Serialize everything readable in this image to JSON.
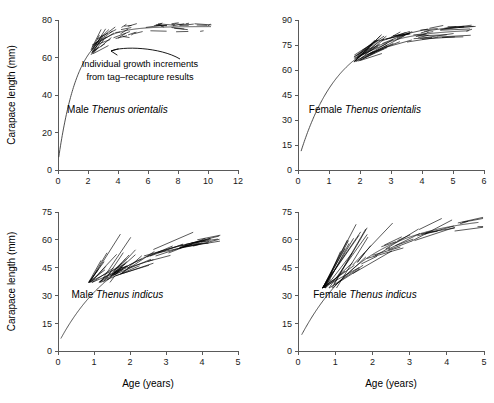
{
  "figure": {
    "name": "lobster-growth-curves",
    "shared_ylabel": "Carapace length (mm)",
    "shared_xlabel": "Age (years)",
    "annotation_line1": "Individual growth increments",
    "annotation_line2": "from tag–recapture results",
    "curve_color": "#3a3a3a",
    "increment_color": "#000000",
    "axis_color": "#5a5a5a",
    "background": "#ffffff"
  },
  "chart_data": [
    {
      "type": "line",
      "panel": "top-left",
      "title": "Male Thenus orientalis",
      "label_plain": "Male ",
      "label_italic": "Thenus orientalis",
      "xlabel": "",
      "ylabel": "Carapace length (mm)",
      "xlim": [
        0,
        12
      ],
      "ylim": [
        0,
        80
      ],
      "xticks": [
        0,
        2,
        4,
        6,
        8,
        10,
        12
      ],
      "yticks": [
        0,
        20,
        40,
        60,
        80
      ],
      "grid": false,
      "legend": "none",
      "annotation": "Individual growth increments from tag–recapture results",
      "growth_model": "von Bertalanffy",
      "Linf": 76.5,
      "K": 0.78,
      "t0": -0.07,
      "curve_x_range": [
        0.05,
        10.2
      ],
      "series": [
        {
          "name": "von Bertalanffy fitted curve",
          "x": [
            0.05,
            0.3,
            0.6,
            1.0,
            1.4,
            1.8,
            2.2,
            2.6,
            3.0,
            3.5,
            4.0,
            4.5,
            5.0,
            6.0,
            7.0,
            8.0,
            9.0,
            10.2
          ],
          "y": [
            4.6,
            20.2,
            33.0,
            45.5,
            54.5,
            61.0,
            65.7,
            69.1,
            71.6,
            73.6,
            74.9,
            75.7,
            76.0,
            76.3,
            76.4,
            76.5,
            76.5,
            76.5
          ]
        }
      ],
      "increments": {
        "count": 58,
        "description": "short line segments joining tag and recapture carapace lengths",
        "x_range": [
          2.2,
          10.0
        ],
        "y_range": [
          58,
          78
        ]
      }
    },
    {
      "type": "line",
      "panel": "top-right",
      "title": "Female Thenus orientalis",
      "label_plain": "Female ",
      "label_italic": "Thenus orientalis",
      "xlabel": "",
      "ylabel": "",
      "xlim": [
        0,
        6
      ],
      "ylim": [
        0,
        90
      ],
      "xticks": [
        0,
        1,
        2,
        3,
        4,
        5,
        6
      ],
      "yticks": [
        0,
        15,
        30,
        45,
        60,
        75,
        90
      ],
      "grid": false,
      "legend": "none",
      "growth_model": "von Bertalanffy",
      "Linf": 84.5,
      "K": 0.8,
      "t0": -0.08,
      "curve_x_range": [
        0.1,
        5.5
      ],
      "series": [
        {
          "name": "von Bertalanffy fitted curve",
          "x": [
            0.1,
            0.3,
            0.6,
            0.9,
            1.2,
            1.5,
            1.8,
            2.1,
            2.5,
            3.0,
            3.5,
            4.0,
            4.5,
            5.0,
            5.5
          ],
          "y": [
            5.5,
            18.5,
            31.5,
            42.0,
            50.8,
            58.0,
            64.0,
            68.8,
            73.8,
            78.2,
            81.0,
            82.7,
            83.6,
            84.1,
            84.4
          ]
        }
      ],
      "increments": {
        "count": 62,
        "description": "short line segments joining tag and recapture carapace lengths",
        "x_range": [
          1.8,
          5.5
        ],
        "y_range": [
          65,
          88
        ]
      }
    },
    {
      "type": "line",
      "panel": "bottom-left",
      "title": "Male Thenus indicus",
      "label_plain": "Male ",
      "label_italic": "Thenus indicus",
      "xlabel": "Age (years)",
      "ylabel": "Carapace length (mm)",
      "xlim": [
        0,
        5
      ],
      "ylim": [
        0,
        75
      ],
      "xticks": [
        0,
        1,
        2,
        3,
        4,
        5
      ],
      "yticks": [
        0,
        15,
        30,
        45,
        60,
        75
      ],
      "grid": false,
      "legend": "none",
      "growth_model": "von Bertalanffy",
      "Linf": 64.0,
      "K": 0.62,
      "t0": -0.1,
      "curve_x_range": [
        0.08,
        4.1
      ],
      "series": [
        {
          "name": "von Bertalanffy fitted curve",
          "x": [
            0.08,
            0.3,
            0.6,
            0.9,
            1.2,
            1.5,
            1.8,
            2.1,
            2.5,
            3.0,
            3.5,
            4.1
          ],
          "y": [
            6.3,
            14.5,
            24.0,
            31.8,
            38.2,
            43.5,
            47.8,
            51.4,
            55.0,
            58.2,
            60.3,
            61.9
          ]
        }
      ],
      "increments": {
        "count": 55,
        "description": "short line segments joining tag and recapture carapace lengths",
        "x_range": [
          0.85,
          4.1
        ],
        "y_range": [
          37,
          64
        ]
      }
    },
    {
      "type": "line",
      "panel": "bottom-right",
      "title": "Female Thenus indicus",
      "label_plain": "Female ",
      "label_italic": "Thenus indicus",
      "xlabel": "Age (years)",
      "ylabel": "",
      "xlim": [
        0,
        5
      ],
      "ylim": [
        0,
        75
      ],
      "xticks": [
        0,
        1,
        2,
        3,
        4,
        5
      ],
      "yticks": [
        0,
        15,
        30,
        45,
        60,
        75
      ],
      "grid": false,
      "legend": "none",
      "growth_model": "von Bertalanffy",
      "Linf": 73.5,
      "K": 0.58,
      "t0": -0.12,
      "curve_x_range": [
        0.1,
        4.85
      ],
      "series": [
        {
          "name": "von Bertalanffy fitted curve",
          "x": [
            0.1,
            0.35,
            0.7,
            1.0,
            1.4,
            1.8,
            2.2,
            2.6,
            3.0,
            3.5,
            4.0,
            4.5,
            4.85
          ],
          "y": [
            5.5,
            16.5,
            29.0,
            37.8,
            47.0,
            54.3,
            59.8,
            63.8,
            66.8,
            69.6,
            71.2,
            72.1,
            72.4
          ]
        }
      ],
      "increments": {
        "count": 50,
        "description": "short line segments joining tag and recapture carapace lengths",
        "x_range": [
          0.65,
          4.85
        ],
        "y_range": [
          34,
          74
        ]
      }
    }
  ]
}
